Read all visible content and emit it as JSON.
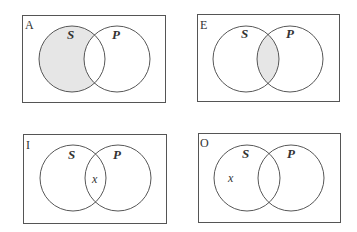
{
  "diagrams": [
    {
      "corner_label": "A",
      "set_left": "S",
      "set_right": "P",
      "shaded_region": "S-only",
      "mark": ""
    },
    {
      "corner_label": "E",
      "set_left": "S",
      "set_right": "P",
      "shaded_region": "S-and-P",
      "mark": ""
    },
    {
      "corner_label": "I",
      "set_left": "S",
      "set_right": "P",
      "shaded_region": "none",
      "mark": "x"
    },
    {
      "corner_label": "O",
      "set_left": "S",
      "set_right": "P",
      "shaded_region": "none",
      "mark": "x"
    }
  ],
  "colors": {
    "shade": "#e6e6e6",
    "stroke": "#444444"
  }
}
